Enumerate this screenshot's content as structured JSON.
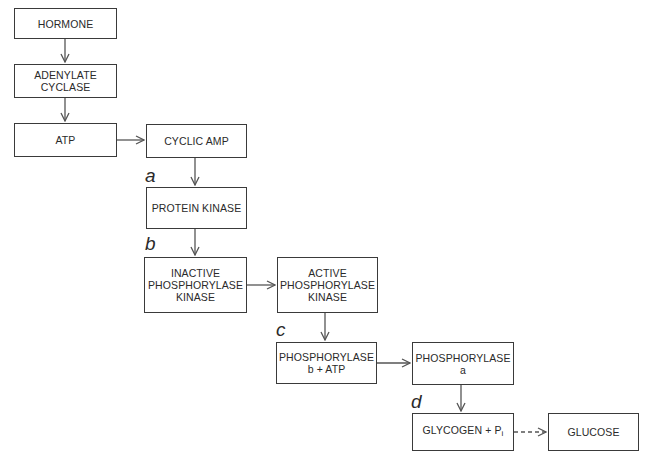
{
  "nodes": {
    "hormone": {
      "lines": [
        "HORMONE"
      ]
    },
    "adenylate_cyclase": {
      "lines": [
        "ADENYLATE",
        "CYCLASE"
      ]
    },
    "atp": {
      "lines": [
        "ATP"
      ]
    },
    "cyclic_amp": {
      "lines": [
        "CYCLIC AMP"
      ]
    },
    "protein_kinase": {
      "lines": [
        "PROTEIN KINASE"
      ]
    },
    "inactive_phosphorylase_kinase": {
      "lines": [
        "INACTIVE",
        "PHOSPHORYLASE",
        "KINASE"
      ]
    },
    "active_phosphorylase_kinase": {
      "lines": [
        "ACTIVE",
        "PHOSPHORYLASE",
        "KINASE"
      ]
    },
    "phosphorylase_b": {
      "lines": [
        "PHOSPHORYLASE",
        "b + ATP"
      ]
    },
    "phosphorylase_a": {
      "lines": [
        "PHOSPHORYLASE",
        "a"
      ]
    },
    "glycogen": {
      "text": "GLYCOGEN + P",
      "subscript": "i"
    },
    "glucose": {
      "lines": [
        "GLUCOSE"
      ]
    }
  },
  "step_labels": {
    "a": "a",
    "b": "b",
    "c": "c",
    "d": "d"
  },
  "edges": [
    {
      "from": "hormone",
      "to": "adenylate_cyclase",
      "style": "solid"
    },
    {
      "from": "adenylate_cyclase",
      "to": "atp",
      "style": "solid"
    },
    {
      "from": "atp",
      "to": "cyclic_amp",
      "style": "solid"
    },
    {
      "from": "cyclic_amp",
      "to": "protein_kinase",
      "style": "solid",
      "label": "a"
    },
    {
      "from": "protein_kinase",
      "to": "inactive_phosphorylase_kinase",
      "style": "solid",
      "label": "b"
    },
    {
      "from": "inactive_phosphorylase_kinase",
      "to": "active_phosphorylase_kinase",
      "style": "solid"
    },
    {
      "from": "active_phosphorylase_kinase",
      "to": "phosphorylase_b",
      "style": "solid",
      "label": "c"
    },
    {
      "from": "phosphorylase_b",
      "to": "phosphorylase_a",
      "style": "solid"
    },
    {
      "from": "phosphorylase_a",
      "to": "glycogen",
      "style": "solid",
      "label": "d"
    },
    {
      "from": "glycogen",
      "to": "glucose",
      "style": "dashed"
    }
  ],
  "colors": {
    "line": "#3a3a3a",
    "arrow": "#555555",
    "background": "#ffffff"
  }
}
